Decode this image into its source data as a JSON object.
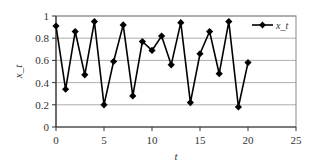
{
  "chart_data": {
    "type": "line",
    "title": "",
    "xlabel": "t",
    "ylabel": "x_t",
    "xlim": [
      0,
      25
    ],
    "ylim": [
      0,
      1
    ],
    "xticks": [
      0,
      5,
      10,
      15,
      20,
      25
    ],
    "xtick_labels": [
      "0",
      "5",
      "10",
      "15",
      "20",
      "25"
    ],
    "yticks": [
      0,
      0.2,
      0.4,
      0.6,
      0.8,
      1
    ],
    "ytick_labels": [
      "0",
      "0.2",
      "0.4",
      "0.6",
      "0.8",
      "1"
    ],
    "grid": "horizontal",
    "legend": {
      "position": "top-right",
      "entries": [
        "x_t"
      ]
    },
    "series": [
      {
        "name": "x_t",
        "marker": "diamond",
        "color": "#000000",
        "x": [
          0,
          1,
          2,
          3,
          4,
          5,
          6,
          7,
          8,
          9,
          10,
          11,
          12,
          13,
          14,
          15,
          16,
          17,
          18,
          19,
          20
        ],
        "values": [
          0.91,
          0.34,
          0.86,
          0.47,
          0.95,
          0.2,
          0.59,
          0.92,
          0.28,
          0.77,
          0.69,
          0.82,
          0.56,
          0.94,
          0.22,
          0.66,
          0.86,
          0.48,
          0.95,
          0.18,
          0.58
        ]
      }
    ]
  }
}
